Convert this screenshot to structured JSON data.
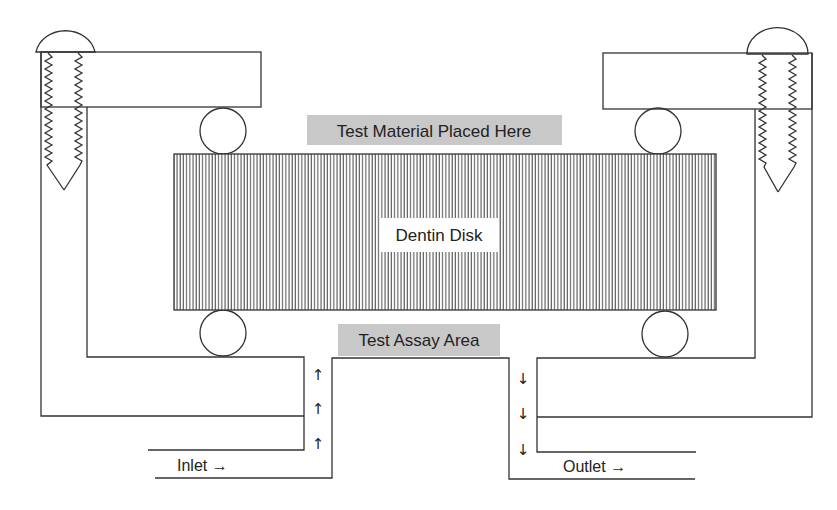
{
  "diagram": {
    "labels": {
      "test_material": "Test Material Placed Here",
      "dentin_disk": "Dentin Disk",
      "test_assay": "Test Assay Area",
      "inlet": "Inlet →",
      "outlet": "Outlet →"
    },
    "flow_arrows": {
      "inlet": [
        "↑",
        "↑",
        "↑"
      ],
      "outlet": [
        "↓",
        "↓",
        "↓"
      ]
    },
    "colors": {
      "line": "#333333",
      "label_bg": "#c8c8c8",
      "hatch": "#444444",
      "background": "#ffffff"
    }
  }
}
